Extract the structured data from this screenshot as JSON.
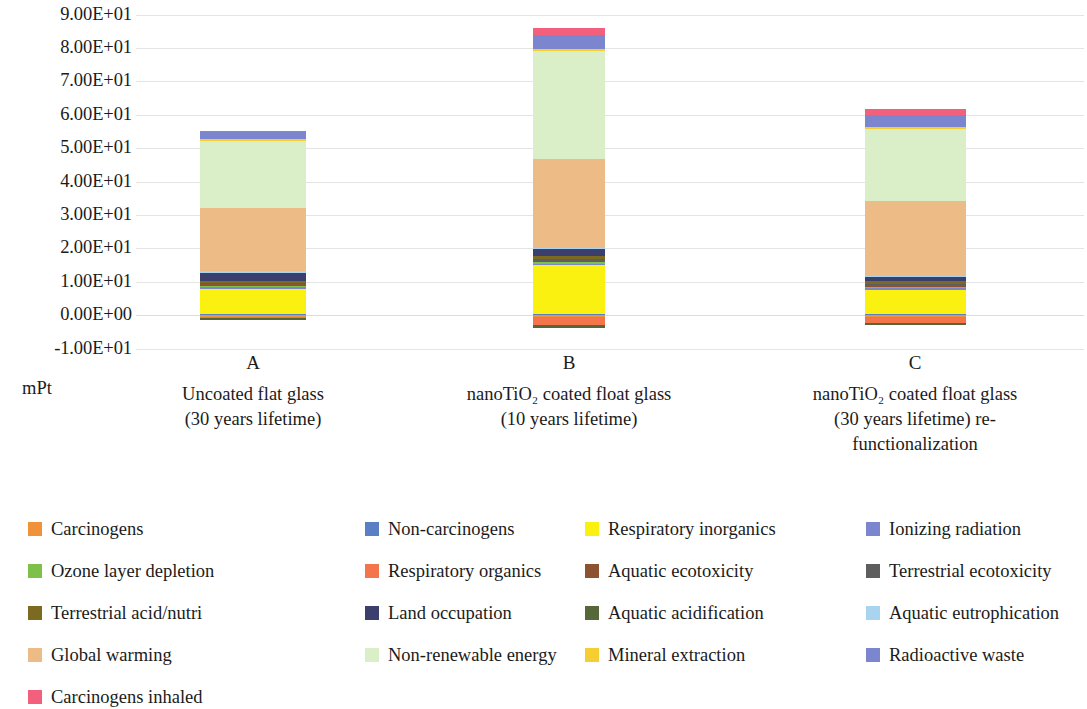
{
  "chart_data": {
    "type": "bar",
    "subtype": "stacked-bar",
    "title": "",
    "xlabel": "",
    "ylabel": "mPt",
    "ylim": [
      -10,
      90
    ],
    "yticks": [
      90,
      80,
      70,
      60,
      50,
      40,
      30,
      20,
      10,
      0,
      -10
    ],
    "ytick_labels": [
      "9.00E+01",
      "8.00E+01",
      "7.00E+01",
      "6.00E+01",
      "5.00E+01",
      "4.00E+01",
      "3.00E+01",
      "2.00E+01",
      "1.00E+01",
      "0.00E+00",
      "-1.00E+01"
    ],
    "grid": true,
    "legend_position": "bottom",
    "categories": [
      {
        "key": "A",
        "letter": "A",
        "desc_line1": "Uncoated flat glass",
        "desc_line2": "(30 years lifetime)",
        "desc_line3": ""
      },
      {
        "key": "B",
        "letter": "B",
        "desc_line1": "nanoTiO₂ coated float glass",
        "desc_line2": "(10 years lifetime)",
        "desc_line3": ""
      },
      {
        "key": "C",
        "letter": "C",
        "desc_line1": "nanoTiO₂ coated float glass",
        "desc_line2": "(30 years lifetime) re-",
        "desc_line3": "functionalization"
      }
    ],
    "series": [
      {
        "name": "Carcinogens",
        "color": "#F0923A",
        "values": [
          0.25,
          0.3,
          0.3
        ]
      },
      {
        "name": "Non-carcinogens",
        "color": "#5B7FC4",
        "values": [
          0.15,
          0.2,
          0.2
        ]
      },
      {
        "name": "Respiratory inorganics",
        "color": "#FAF111",
        "values": [
          7.4,
          14.5,
          7.2
        ]
      },
      {
        "name": "Ionizing radiation",
        "color": "#7B86CE",
        "values": [
          0.1,
          0.15,
          0.15
        ]
      },
      {
        "name": "Ozone layer depletion",
        "color": "#7DC14A",
        "values": [
          0.1,
          0.15,
          0.12
        ]
      },
      {
        "name": "Respiratory organics",
        "color": "#F4744C",
        "values": [
          0.1,
          2.6,
          2.0
        ]
      },
      {
        "name": "Aquatic ecotoxicity",
        "color": "#8C5232",
        "values": [
          0.08,
          0.1,
          0.1
        ]
      },
      {
        "name": "Terrestrial ecotoxicity",
        "color": "#5E5E5E",
        "values": [
          0.35,
          0.45,
          0.4
        ]
      },
      {
        "name": "Terrestrial acid/nutri",
        "color": "#7C6A20",
        "values": [
          0.6,
          0.8,
          0.7
        ]
      },
      {
        "name": "Land occupation",
        "color": "#3A3F6E",
        "values": [
          2.4,
          2.1,
          1.2
        ]
      },
      {
        "name": "Aquatic acidification",
        "color": "#56683A",
        "values": [
          0.15,
          0.8,
          0.6
        ]
      },
      {
        "name": "Aquatic eutrophication",
        "color": "#A8D4F0",
        "values": [
          0.05,
          0.08,
          0.07
        ]
      },
      {
        "name": "Global warming",
        "color": "#EDBB86",
        "values": [
          18.9,
          26.5,
          22.4
        ]
      },
      {
        "name": "Non-renewable energy",
        "color": "#DAEEC8",
        "values": [
          20.2,
          32.6,
          21.6
        ]
      },
      {
        "name": "Mineral extraction",
        "color": "#F7CE32",
        "values": [
          0.1,
          0.12,
          0.12
        ]
      },
      {
        "name": "Radioactive waste",
        "color": "#7B86CE",
        "values": [
          2.1,
          4.2,
          3.6
        ]
      },
      {
        "name": "Carcinogens inhaled",
        "color": "#F2607E",
        "values": [
          0.1,
          2.0,
          1.8
        ]
      }
    ],
    "totals": [
      49.0,
      77.5,
      59.5
    ]
  },
  "legend": {
    "items": [
      {
        "label": "Carcinogens",
        "color": "#F0923A"
      },
      {
        "label": "Non-carcinogens",
        "color": "#5B7FC4"
      },
      {
        "label": "Respiratory inorganics",
        "color": "#FAF111"
      },
      {
        "label": "Ionizing radiation",
        "color": "#7B86CE"
      },
      {
        "label": "Ozone layer depletion",
        "color": "#7DC14A"
      },
      {
        "label": "Respiratory organics",
        "color": "#F4744C"
      },
      {
        "label": "Aquatic ecotoxicity",
        "color": "#8C5232"
      },
      {
        "label": "Terrestrial ecotoxicity",
        "color": "#5E5E5E"
      },
      {
        "label": "Terrestrial acid/nutri",
        "color": "#7C6A20"
      },
      {
        "label": "Land occupation",
        "color": "#3A3F6E"
      },
      {
        "label": "Aquatic acidification",
        "color": "#56683A"
      },
      {
        "label": "Aquatic eutrophication",
        "color": "#A8D4F0"
      },
      {
        "label": "Global warming",
        "color": "#EDBB86"
      },
      {
        "label": "Non-renewable energy",
        "color": "#DAEEC8"
      },
      {
        "label": "Mineral extraction",
        "color": "#F7CE32"
      },
      {
        "label": "Radioactive waste",
        "color": "#7B86CE"
      },
      {
        "label": "Carcinogens inhaled",
        "color": "#F2607E"
      }
    ]
  }
}
